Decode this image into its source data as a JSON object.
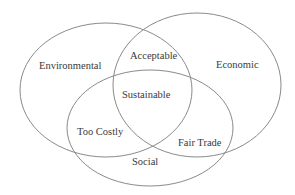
{
  "diagram": {
    "type": "venn",
    "sets": [
      {
        "id": "environmental",
        "label": "Environmental"
      },
      {
        "id": "economic",
        "label": "Economic"
      },
      {
        "id": "social",
        "label": "Social"
      }
    ],
    "intersections": {
      "environmental_economic": "Acceptable",
      "environmental_social": "Too Costly",
      "economic_social": "Fair Trade",
      "all": "Sustainable"
    },
    "colors": {
      "stroke": "#8a8a8a",
      "text": "#3a3a3a",
      "background": "#ffffff"
    }
  }
}
